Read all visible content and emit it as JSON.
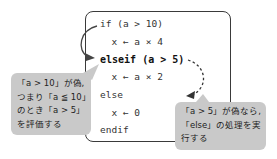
{
  "code": {
    "lines": [
      {
        "text": "if (a > 10)",
        "emphasis": false
      },
      {
        "text": "  x ← a × 4",
        "emphasis": false
      },
      {
        "text": "elseif (a > 5)",
        "emphasis": true
      },
      {
        "text": "  x ← a × 2",
        "emphasis": false
      },
      {
        "text": "else",
        "emphasis": false
      },
      {
        "text": "  x ← 0",
        "emphasis": false
      },
      {
        "text": "endif",
        "emphasis": false
      }
    ]
  },
  "callouts": {
    "left": {
      "lines": [
        "「a > 10」が偽,",
        "つまり「a ≦ 10」",
        "のとき「a > 5」",
        "を評価する"
      ]
    },
    "right": {
      "lines": [
        "「a > 5」が偽なら,",
        "「else」の処理を実",
        "行する"
      ]
    }
  },
  "arrows": {
    "left": {
      "style": "solid",
      "from": "if",
      "to": "elseif"
    },
    "right": {
      "style": "dashed",
      "from": "elseif",
      "to": "else"
    }
  },
  "colors": {
    "callout_bg": "#c9c9c9",
    "border": "#3a3a3a",
    "text": "#333333"
  }
}
